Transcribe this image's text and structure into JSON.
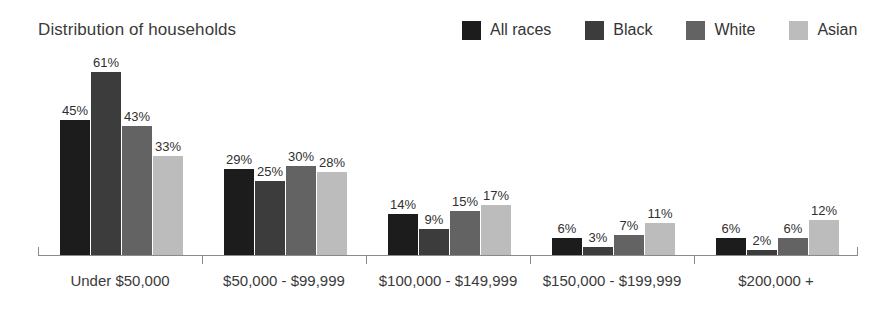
{
  "chart_data": {
    "type": "bar",
    "title": "Distribution of households",
    "xlabel": "",
    "ylabel": "",
    "ylim": [
      0,
      65
    ],
    "grid": false,
    "legend_position": "top-right",
    "value_suffix": "%",
    "categories": [
      "Under $50,000",
      "$50,000 - $99,999",
      "$100,000 - $149,999",
      "$150,000 - $199,999",
      "$200,000 +"
    ],
    "series": [
      {
        "name": "All races",
        "color": "#1c1c1c",
        "values": [
          45,
          29,
          14,
          6,
          6
        ]
      },
      {
        "name": "Black",
        "color": "#3c3c3c",
        "values": [
          61,
          25,
          9,
          3,
          2
        ]
      },
      {
        "name": "White",
        "color": "#636363",
        "values": [
          43,
          30,
          15,
          7,
          6
        ]
      },
      {
        "name": "Asian",
        "color": "#bcbcbc",
        "values": [
          33,
          28,
          17,
          11,
          12
        ]
      }
    ],
    "data_labels": [
      [
        "45%",
        "61%",
        "43%",
        "33%"
      ],
      [
        "29%",
        "25%",
        "30%",
        "28%"
      ],
      [
        "14%",
        "9%",
        "15%",
        "17%"
      ],
      [
        "6%",
        "3%",
        "7%",
        "11%"
      ],
      [
        "6%",
        "2%",
        "6%",
        "12%"
      ]
    ],
    "axis_color": "#8a8a8a"
  }
}
